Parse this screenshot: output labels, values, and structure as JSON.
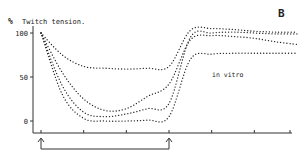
{
  "panel_label": "B",
  "ylabel_unit": "%",
  "ylabel": "Twitch tension.",
  "annotation": "in vitro",
  "colors": {
    "ink": "#222222",
    "background": "#ffffff"
  },
  "chart_data": {
    "type": "line",
    "title": "",
    "panel": "B",
    "xlabel": "",
    "ylabel": "% Twitch tension.",
    "yticks": [
      0,
      50,
      100
    ],
    "ylim": [
      -5,
      110
    ],
    "x": [
      0,
      0.5,
      1,
      1.5,
      2,
      2.5,
      3,
      3.5,
      4,
      4.5,
      5,
      5.5,
      6
    ],
    "xticks": [
      0,
      1,
      2,
      3,
      4,
      5,
      6
    ],
    "xlim": [
      0,
      6.2
    ],
    "grid": false,
    "legend": null,
    "line_style": "dotted",
    "annotations": [
      {
        "text": "in vitro",
        "x": 4.6,
        "y": 60
      },
      {
        "text": "B",
        "x": 5.9,
        "y": 118,
        "role": "panel-label"
      }
    ],
    "markers": [
      {
        "type": "up-arrow",
        "x": 0
      },
      {
        "type": "up-arrow",
        "x": 3
      },
      {
        "type": "bracket",
        "from": 0,
        "to": 3
      }
    ],
    "series": [
      {
        "name": "curve-1",
        "values": [
          100,
          75,
          62,
          60,
          59,
          60,
          62,
          103,
          105,
          104,
          102,
          101,
          101
        ]
      },
      {
        "name": "curve-2",
        "values": [
          100,
          55,
          25,
          12,
          14,
          28,
          42,
          92,
          97,
          96,
          94,
          90,
          87
        ]
      },
      {
        "name": "curve-3",
        "values": [
          100,
          40,
          10,
          5,
          8,
          14,
          20,
          95,
          100,
          101,
          100,
          99,
          99
        ]
      },
      {
        "name": "curve-4",
        "values": [
          100,
          30,
          3,
          0,
          0,
          1,
          5,
          70,
          76,
          77,
          77,
          77,
          77
        ]
      }
    ]
  }
}
